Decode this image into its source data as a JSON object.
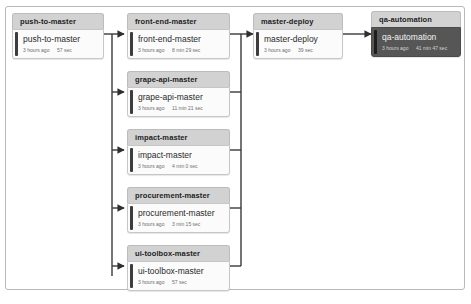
{
  "diagram": {
    "type": "ci-pipeline-graph",
    "title_visible": false,
    "colors": {
      "frame_border": "#b9b9b9",
      "card_header_bg": "#d2d2d2",
      "card_body_bg": "#fbfbfb",
      "status_bar": "#3c3c3c",
      "selected_body_bg": "#565656",
      "selected_text": "#f2f2f2",
      "connector": "#3a3a3a",
      "canvas_bg": "#ffffff"
    }
  },
  "stages": {
    "push_to_master": {
      "header": "push-to-master",
      "job_name": "push-to-master",
      "when": "3 hours ago",
      "duration": "57 sec",
      "selected": false
    },
    "front_end_master": {
      "header": "front-end-master",
      "job_name": "front-end-master",
      "when": "3 hours ago",
      "duration": "8 min 29 sec",
      "selected": false
    },
    "grape_api_master": {
      "header": "grape-api-master",
      "job_name": "grape-api-master",
      "when": "3 hours ago",
      "duration": "11 min 21 sec",
      "selected": false
    },
    "impact_master": {
      "header": "impact-master",
      "job_name": "impact-master",
      "when": "3 hours ago",
      "duration": "4 min 0 sec",
      "selected": false
    },
    "procurement_master": {
      "header": "procurement-master",
      "job_name": "procurement-master",
      "when": "3 hours ago",
      "duration": "3 min 15 sec",
      "selected": false
    },
    "ui_toolbox_master": {
      "header": "ui-toolbox-master",
      "job_name": "ui-toolbox-master",
      "when": "3 hours ago",
      "duration": "57 sec",
      "selected": false
    },
    "master_deploy": {
      "header": "master-deploy",
      "job_name": "master-deploy",
      "when": "3 hours ago",
      "duration": "39 sec",
      "selected": false
    },
    "qa_automation": {
      "header": "qa-automation",
      "job_name": "qa-automation",
      "when": "3 hours ago",
      "duration": "41 min 47 sec",
      "selected": true
    }
  },
  "edges": [
    {
      "from": "push-to-master",
      "to": "front-end-master"
    },
    {
      "from": "push-to-master",
      "to": "grape-api-master"
    },
    {
      "from": "push-to-master",
      "to": "impact-master"
    },
    {
      "from": "push-to-master",
      "to": "procurement-master"
    },
    {
      "from": "push-to-master",
      "to": "ui-toolbox-master"
    },
    {
      "from": "front-end-master",
      "to": "master-deploy"
    },
    {
      "from": "grape-api-master",
      "to": "master-deploy"
    },
    {
      "from": "impact-master",
      "to": "master-deploy"
    },
    {
      "from": "procurement-master",
      "to": "master-deploy"
    },
    {
      "from": "ui-toolbox-master",
      "to": "master-deploy"
    },
    {
      "from": "master-deploy",
      "to": "qa-automation"
    }
  ]
}
